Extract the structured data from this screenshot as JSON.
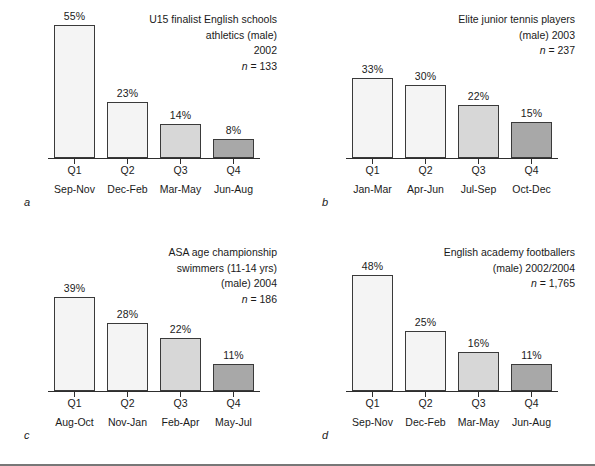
{
  "figure": {
    "panels": [
      {
        "letter": "a",
        "caption_lines": [
          "U15 finalist English schools",
          "athletics (male)",
          "2002"
        ],
        "n_prefix": "n",
        "n_eq": " = ",
        "n_value": "133",
        "chart_data": {
          "type": "bar",
          "title": "U15 finalist English schools athletics (male) 2002",
          "categories": [
            "Q1",
            "Q2",
            "Q3",
            "Q4"
          ],
          "category_subtitles": [
            "Sep-Nov",
            "Dec-Feb",
            "Mar-May",
            "Jun-Aug"
          ],
          "values": [
            55,
            23,
            14,
            8
          ],
          "value_labels": [
            "55%",
            "23%",
            "14%",
            "8%"
          ],
          "xlabel": "",
          "ylabel": "",
          "ylim": [
            0,
            60
          ],
          "grid": false,
          "legend": "none",
          "n": 133,
          "bar_shades": [
            "shade-light",
            "shade-light",
            "shade-mid",
            "shade-dark"
          ]
        }
      },
      {
        "letter": "b",
        "caption_lines": [
          "Elite junior tennis players",
          "(male) 2003"
        ],
        "n_prefix": "n",
        "n_eq": " = ",
        "n_value": "237",
        "chart_data": {
          "type": "bar",
          "title": "Elite junior tennis players (male) 2003",
          "categories": [
            "Q1",
            "Q2",
            "Q3",
            "Q4"
          ],
          "category_subtitles": [
            "Jan-Mar",
            "Apr-Jun",
            "Jul-Sep",
            "Oct-Dec"
          ],
          "values": [
            33,
            30,
            22,
            15
          ],
          "value_labels": [
            "33%",
            "30%",
            "22%",
            "15%"
          ],
          "xlabel": "",
          "ylabel": "",
          "ylim": [
            0,
            60
          ],
          "grid": false,
          "legend": "none",
          "n": 237,
          "bar_shades": [
            "shade-light",
            "shade-light",
            "shade-mid",
            "shade-dark"
          ]
        }
      },
      {
        "letter": "c",
        "caption_lines": [
          "ASA age championship",
          "swimmers (11-14 yrs)",
          "(male) 2004"
        ],
        "n_prefix": "n",
        "n_eq": " = ",
        "n_value": "186",
        "chart_data": {
          "type": "bar",
          "title": "ASA age championship swimmers (11-14 yrs) (male) 2004",
          "categories": [
            "Q1",
            "Q2",
            "Q3",
            "Q4"
          ],
          "category_subtitles": [
            "Aug-Oct",
            "Nov-Jan",
            "Feb-Apr",
            "May-Jul"
          ],
          "values": [
            39,
            28,
            22,
            11
          ],
          "value_labels": [
            "39%",
            "28%",
            "22%",
            "11%"
          ],
          "xlabel": "",
          "ylabel": "",
          "ylim": [
            0,
            60
          ],
          "grid": false,
          "legend": "none",
          "n": 186,
          "bar_shades": [
            "shade-light",
            "shade-light",
            "shade-mid",
            "shade-dark"
          ]
        }
      },
      {
        "letter": "d",
        "caption_lines": [
          "English academy footballers",
          "(male) 2002/2004"
        ],
        "n_prefix": "n",
        "n_eq": " = ",
        "n_value": "1,765",
        "chart_data": {
          "type": "bar",
          "title": "English academy footballers (male) 2002/2004",
          "categories": [
            "Q1",
            "Q2",
            "Q3",
            "Q4"
          ],
          "category_subtitles": [
            "Sep-Nov",
            "Dec-Feb",
            "Mar-May",
            "Jun-Aug"
          ],
          "values": [
            48,
            25,
            16,
            11
          ],
          "value_labels": [
            "48%",
            "25%",
            "16%",
            "11%"
          ],
          "xlabel": "",
          "ylabel": "",
          "ylim": [
            0,
            60
          ],
          "grid": false,
          "legend": "none",
          "n": 1765,
          "bar_shades": [
            "shade-light",
            "shade-light",
            "shade-mid",
            "shade-dark"
          ]
        }
      }
    ],
    "colors": {
      "axis": "#2e2e2e",
      "bar_outline": "#3a3a3a",
      "bar_light": "#f4f4f4",
      "bar_mid": "#d7d7d7",
      "bar_dark": "#a8a8a8",
      "text": "#1a1a1a",
      "background": "#ffffff"
    },
    "scale": {
      "max_percent": 60,
      "plot_height_px": 145
    }
  },
  "chart_data": [
    {
      "type": "bar",
      "title": "U15 finalist English schools athletics (male) 2002",
      "categories": [
        "Q1",
        "Q2",
        "Q3",
        "Q4"
      ],
      "category_subtitles": [
        "Sep-Nov",
        "Dec-Feb",
        "Mar-May",
        "Jun-Aug"
      ],
      "values": [
        55,
        23,
        14,
        8
      ],
      "ylim": [
        0,
        60
      ],
      "ylabel": "",
      "xlabel": "",
      "grid": false,
      "panel": "a",
      "n": 133
    },
    {
      "type": "bar",
      "title": "Elite junior tennis players (male) 2003",
      "categories": [
        "Q1",
        "Q2",
        "Q3",
        "Q4"
      ],
      "category_subtitles": [
        "Jan-Mar",
        "Apr-Jun",
        "Jul-Sep",
        "Oct-Dec"
      ],
      "values": [
        33,
        30,
        22,
        15
      ],
      "ylim": [
        0,
        60
      ],
      "ylabel": "",
      "xlabel": "",
      "grid": false,
      "panel": "b",
      "n": 237
    },
    {
      "type": "bar",
      "title": "ASA age championship swimmers (11-14 yrs) (male) 2004",
      "categories": [
        "Q1",
        "Q2",
        "Q3",
        "Q4"
      ],
      "category_subtitles": [
        "Aug-Oct",
        "Nov-Jan",
        "Feb-Apr",
        "May-Jul"
      ],
      "values": [
        39,
        28,
        22,
        11
      ],
      "ylim": [
        0,
        60
      ],
      "ylabel": "",
      "xlabel": "",
      "grid": false,
      "panel": "c",
      "n": 186
    },
    {
      "type": "bar",
      "title": "English academy footballers (male) 2002/2004",
      "categories": [
        "Q1",
        "Q2",
        "Q3",
        "Q4"
      ],
      "category_subtitles": [
        "Sep-Nov",
        "Dec-Feb",
        "Mar-May",
        "Jun-Aug"
      ],
      "values": [
        48,
        25,
        16,
        11
      ],
      "ylim": [
        0,
        60
      ],
      "ylabel": "",
      "xlabel": "",
      "grid": false,
      "panel": "d",
      "n": 1765
    }
  ]
}
